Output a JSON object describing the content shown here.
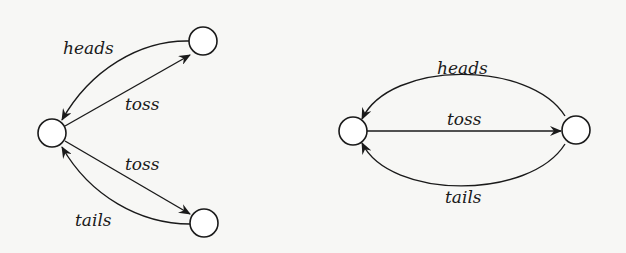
{
  "diagrams": [
    {
      "name": "branching-coin-toss",
      "nodes": [
        {
          "id": "start",
          "cx": 52,
          "cy": 133,
          "r": 14
        },
        {
          "id": "heads-state",
          "cx": 203,
          "cy": 41,
          "r": 14
        },
        {
          "id": "tails-state",
          "cx": 204,
          "cy": 223,
          "r": 14
        }
      ],
      "edges": [
        {
          "from": "start",
          "to": "heads-state",
          "label": "toss"
        },
        {
          "from": "heads-state",
          "to": "start",
          "label": "heads"
        },
        {
          "from": "start",
          "to": "tails-state",
          "label": "toss"
        },
        {
          "from": "tails-state",
          "to": "start",
          "label": "tails"
        }
      ]
    },
    {
      "name": "two-state-coin-toss",
      "nodes": [
        {
          "id": "left",
          "cx": 353,
          "cy": 131,
          "r": 14
        },
        {
          "id": "right",
          "cx": 576,
          "cy": 130,
          "r": 14
        }
      ],
      "edges": [
        {
          "from": "right",
          "to": "left",
          "label": "heads"
        },
        {
          "from": "left",
          "to": "right",
          "label": "toss"
        },
        {
          "from": "right",
          "to": "left",
          "label": "tails"
        }
      ]
    }
  ],
  "labels": {
    "d1_heads": "heads",
    "d1_toss_upper": "toss",
    "d1_toss_lower": "toss",
    "d1_tails": "tails",
    "d2_heads": "heads",
    "d2_toss": "toss",
    "d2_tails": "tails"
  },
  "colors": {
    "stroke": "#1a1a1a",
    "background": "#f7f7f5",
    "node_fill": "#ffffff"
  }
}
